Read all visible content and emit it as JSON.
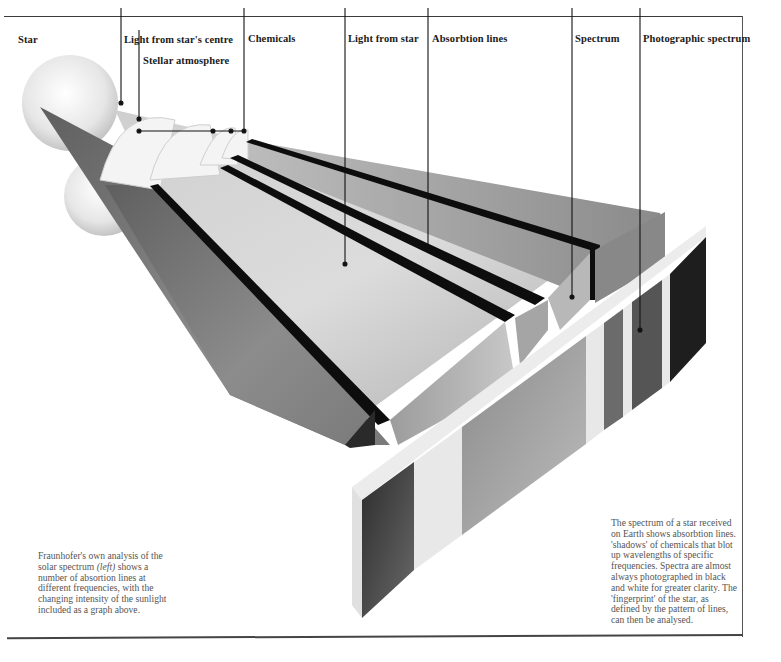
{
  "labels": {
    "star": "Star",
    "light_from_centre": "Light from star's centre",
    "stellar_atmosphere": "Stellar atmosphere",
    "chemicals": "Chemicals",
    "light_from_star": "Light from star",
    "absorption_lines": "Absorbtion lines",
    "spectrum": "Spectrum",
    "photographic_spectrum": "Photographic spectrum"
  },
  "captions": {
    "left": {
      "part1": "Fraunhofer's own analysis of the solar spectrum ",
      "italic": "(left)",
      "part2": " shows a number of absortion lines at different frequencies, with the changing intensity of the sunlight included as a graph above."
    },
    "right": "The spectrum of a star received on Earth shows absorbtion lines. 'shadows' of chemicals that blot up wavelengths of specific frequencies. Spectra are almost always photographed in black and white for greater clarity. The 'fingerprint' of the star, as defined by the pattern of lines, can then be analysed."
  },
  "colors": {
    "background": "#ffffff",
    "text": "#1a1a1a",
    "caption_text": "#555555",
    "beam_dark": "#6e6e6e",
    "beam_light": "#d9d9d9",
    "absorption_line": "#0d0d0d",
    "film_edge": "#ececec"
  }
}
